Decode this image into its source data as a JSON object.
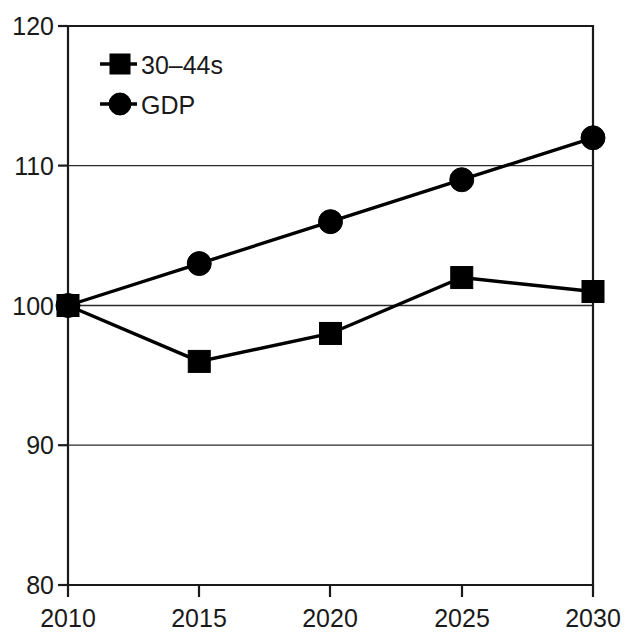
{
  "chart_data": {
    "type": "line",
    "title": "",
    "subtitle": "",
    "xlabel": "",
    "ylabel": "",
    "x": [
      2010,
      2015,
      2020,
      2025,
      2030
    ],
    "categories": [
      "2010",
      "2015",
      "2020",
      "2025",
      "2030"
    ],
    "xlim": [
      2010,
      2030
    ],
    "ylim": [
      80,
      120
    ],
    "y_ticks": [
      80,
      90,
      100,
      110,
      120
    ],
    "y_tick_labels": [
      "80",
      "90",
      "100",
      "110",
      "120"
    ],
    "x_ticks": [
      2010,
      2015,
      2020,
      2025,
      2030
    ],
    "x_tick_labels": [
      "2010",
      "2015",
      "2020",
      "2025",
      "2030"
    ],
    "grid": "horizontal",
    "legend_position": "top-left-inside",
    "series": [
      {
        "name": "30–44s",
        "marker": "square",
        "color": "#000000",
        "values": [
          100,
          96,
          98,
          102,
          101
        ]
      },
      {
        "name": "GDP",
        "marker": "circle",
        "color": "#000000",
        "values": [
          100,
          103,
          106,
          109,
          112
        ]
      }
    ]
  },
  "legend": {
    "entries": [
      {
        "label": "30–44s",
        "marker": "square"
      },
      {
        "label": "GDP",
        "marker": "circle"
      }
    ]
  },
  "axes": {
    "y_labels": [
      "120",
      "110",
      "100",
      "90",
      "80"
    ],
    "x_labels": [
      "2010",
      "2015",
      "2020",
      "2025",
      "2030"
    ]
  },
  "colors": {
    "line": "#000000",
    "axis": "#1a1a1a",
    "grid": "#2b2b2b",
    "background": "#ffffff"
  }
}
